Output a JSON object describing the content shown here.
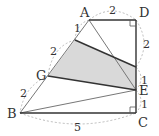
{
  "diagram": {
    "type": "geometry-figure",
    "points": {
      "A": {
        "label": "A",
        "x": 89,
        "y": 20
      },
      "D": {
        "label": "D",
        "x": 136,
        "y": 20
      },
      "B": {
        "label": "B",
        "x": 20,
        "y": 113
      },
      "C": {
        "label": "C",
        "x": 136,
        "y": 113
      },
      "E": {
        "label": "E",
        "x": 136,
        "y": 90
      },
      "G": {
        "label": "G",
        "x": 48,
        "y": 76
      },
      "P": {
        "label": "",
        "x": 75,
        "y": 40
      },
      "Q": {
        "label": "",
        "x": 136,
        "y": 67
      }
    },
    "segment_lengths": {
      "AD": "2",
      "DQ": "2",
      "QE": "1",
      "EC": "1",
      "BC": "5",
      "AP": "1",
      "PG": "2",
      "GB": "2"
    },
    "shaded_region": [
      "P",
      "Q",
      "E",
      "G"
    ],
    "right_angles": [
      "D",
      "C"
    ],
    "colors": {
      "shade": "#d9d9d9",
      "thick_line": "#333333",
      "thin_line": "#777777",
      "dashed_arc": "#aaaaaa"
    }
  }
}
